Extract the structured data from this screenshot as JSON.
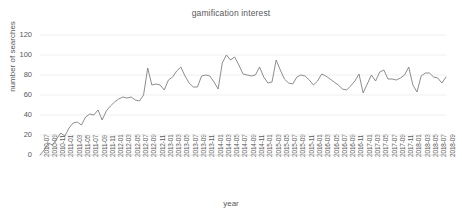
{
  "chart_data": {
    "type": "line",
    "title": "gamification interest",
    "xlabel": "year",
    "ylabel": "number of searches",
    "ylim": [
      0,
      120
    ],
    "ytick_values": [
      0,
      20,
      40,
      60,
      80,
      100,
      120
    ],
    "grid": true,
    "legend": "none",
    "line_color": "#808080",
    "x": [
      "2010-07",
      "2010-08",
      "2010-09",
      "2010-10",
      "2010-11",
      "2010-12",
      "2011-01",
      "2011-02",
      "2011-03",
      "2011-04",
      "2011-05",
      "2011-06",
      "2011-07",
      "2011-08",
      "2011-09",
      "2011-10",
      "2011-11",
      "2011-12",
      "2012-01",
      "2012-02",
      "2012-03",
      "2012-04",
      "2012-05",
      "2012-06",
      "2012-07",
      "2012-08",
      "2012-09",
      "2012-10",
      "2012-11",
      "2012-12",
      "2013-01",
      "2013-02",
      "2013-03",
      "2013-04",
      "2013-05",
      "2013-06",
      "2013-07",
      "2013-08",
      "2013-09",
      "2013-10",
      "2013-11",
      "2013-12",
      "2014-01",
      "2014-02",
      "2014-03",
      "2014-04",
      "2014-05",
      "2014-06",
      "2014-07",
      "2014-08",
      "2014-09",
      "2014-10",
      "2014-11",
      "2014-12",
      "2015-01",
      "2015-02",
      "2015-03",
      "2015-04",
      "2015-05",
      "2015-06",
      "2015-07",
      "2015-08",
      "2015-09",
      "2015-10",
      "2015-11",
      "2015-12",
      "2016-01",
      "2016-02",
      "2016-03",
      "2016-04",
      "2016-05",
      "2016-06",
      "2016-07",
      "2016-08",
      "2016-09",
      "2016-10",
      "2016-11",
      "2016-12",
      "2017-01",
      "2017-02",
      "2017-03",
      "2017-04",
      "2017-05",
      "2017-06",
      "2017-07",
      "2017-08",
      "2017-09",
      "2017-10",
      "2017-11",
      "2017-12",
      "2018-01",
      "2018-02",
      "2018-03",
      "2018-04",
      "2018-05",
      "2018-06",
      "2018-07",
      "2018-08",
      "2018-09"
    ],
    "xtick_labels": [
      "2010-07",
      "2010-09",
      "2010-11",
      "2011-01",
      "2011-03",
      "2011-05",
      "2011-07",
      "2011-09",
      "2011-11",
      "2012-01",
      "2012-03",
      "2012-05",
      "2012-07",
      "2012-09",
      "2012-11",
      "2013-01",
      "2013-03",
      "2013-05",
      "2013-07",
      "2013-09",
      "2013-11",
      "2014-01",
      "2014-03",
      "2014-05",
      "2014-07",
      "2014-09",
      "2014-11",
      "2015-01",
      "2015-03",
      "2015-05",
      "2015-07",
      "2015-09",
      "2015-11",
      "2016-01",
      "2016-03",
      "2016-05",
      "2016-07",
      "2016-09",
      "2016-11",
      "2017-01",
      "2017-03",
      "2017-05",
      "2017-07",
      "2017-09",
      "2017-11",
      "2018-01",
      "2018-03",
      "2018-05",
      "2018-07",
      "2018-09"
    ],
    "values": [
      0,
      5,
      12,
      10,
      16,
      22,
      19,
      27,
      32,
      33,
      30,
      38,
      41,
      40,
      45,
      35,
      44,
      49,
      53,
      56,
      58,
      57,
      58,
      55,
      54,
      60,
      87,
      70,
      71,
      70,
      65,
      75,
      78,
      84,
      88,
      79,
      72,
      68,
      68,
      79,
      80,
      79,
      73,
      66,
      92,
      100,
      95,
      98,
      90,
      81,
      80,
      79,
      80,
      88,
      78,
      72,
      73,
      95,
      85,
      76,
      72,
      71,
      78,
      80,
      79,
      75,
      70,
      74,
      81,
      79,
      76,
      73,
      70,
      66,
      65,
      69,
      74,
      81,
      62,
      71,
      80,
      74,
      83,
      85,
      76,
      76,
      75,
      77,
      80,
      88,
      70,
      63,
      79,
      82,
      82,
      78,
      77,
      72,
      78
    ]
  }
}
